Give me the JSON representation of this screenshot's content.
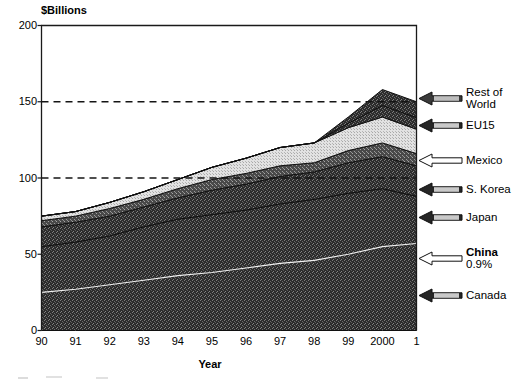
{
  "chart_data": {
    "type": "area",
    "stacked": true,
    "title": "",
    "subtitle": "",
    "ylabel": "$Billions",
    "xlabel": "Year",
    "ylim": [
      0,
      200
    ],
    "yticks": [
      0,
      50,
      100,
      150,
      200
    ],
    "ytick_labels": [
      "0",
      "50",
      "100",
      "150",
      "200"
    ],
    "gridlines": [
      100,
      150
    ],
    "grid": "dashed-horizontal",
    "legend_position": "right-outside",
    "x": [
      "90",
      "91",
      "92",
      "93",
      "94",
      "95",
      "96",
      "97",
      "98",
      "99",
      "2000",
      "1"
    ],
    "xtick_labels": [
      "90",
      "91",
      "92",
      "93",
      "94",
      "95",
      "96",
      "97",
      "98",
      "99",
      "2000",
      "1"
    ],
    "series": [
      {
        "name": "Canada",
        "fill": "dark-speckle",
        "values": [
          55,
          58,
          62,
          68,
          73,
          76,
          79,
          83,
          86,
          90,
          93,
          88
        ]
      },
      {
        "name": "Japan",
        "fill": "dark-speckle",
        "values": [
          13,
          13,
          13,
          13,
          14,
          16,
          17,
          18,
          18,
          20,
          21,
          20
        ]
      },
      {
        "name": "S. Korea",
        "fill": "medium-speckle",
        "values": [
          4,
          4,
          5,
          5,
          6,
          7,
          7,
          7,
          6,
          8,
          9,
          8
        ]
      },
      {
        "name": "Mexico",
        "fill": "light-hatch",
        "values": [
          3,
          3,
          4,
          5,
          6,
          8,
          10,
          12,
          13,
          15,
          17,
          16
        ]
      },
      {
        "name": "EU15",
        "fill": "dark-speckle",
        "values": [
          0,
          0,
          0,
          0,
          0,
          0,
          0,
          0,
          0,
          0,
          0,
          0
        ]
      },
      {
        "name": "Rest of World",
        "fill": "dark-speckle",
        "values": [
          0,
          0,
          0,
          0,
          0,
          0,
          0,
          0,
          0,
          0,
          0,
          0
        ]
      }
    ],
    "overlay_lines": [
      {
        "name": "China",
        "values": [
          25,
          27,
          30,
          33,
          36,
          38,
          41,
          44,
          46,
          50,
          55,
          57
        ],
        "annotation": "0.9%"
      }
    ],
    "stack_totals": [
      72,
      75,
      80,
      88,
      96,
      104,
      110,
      118,
      122,
      140,
      158,
      150
    ]
  },
  "axes": {
    "y_title": "$Billions",
    "x_title": "Year"
  },
  "legend": {
    "items": [
      {
        "label": "Rest of\nWorld",
        "arrow": "hatched-arrow-left",
        "bold": false,
        "sub": ""
      },
      {
        "label": "EU15",
        "arrow": "dark-arrow-left",
        "bold": false,
        "sub": ""
      },
      {
        "label": "Mexico",
        "arrow": "white-arrow-left",
        "bold": false,
        "sub": ""
      },
      {
        "label": "S. Korea",
        "arrow": "dark-arrow-left",
        "bold": false,
        "sub": ""
      },
      {
        "label": "Japan",
        "arrow": "dark-arrow-left",
        "bold": false,
        "sub": ""
      },
      {
        "label": "China",
        "arrow": "white-arrow-left",
        "bold": true,
        "sub": "0.9%"
      },
      {
        "label": "Canada",
        "arrow": "dark-arrow-left",
        "bold": false,
        "sub": ""
      }
    ]
  }
}
